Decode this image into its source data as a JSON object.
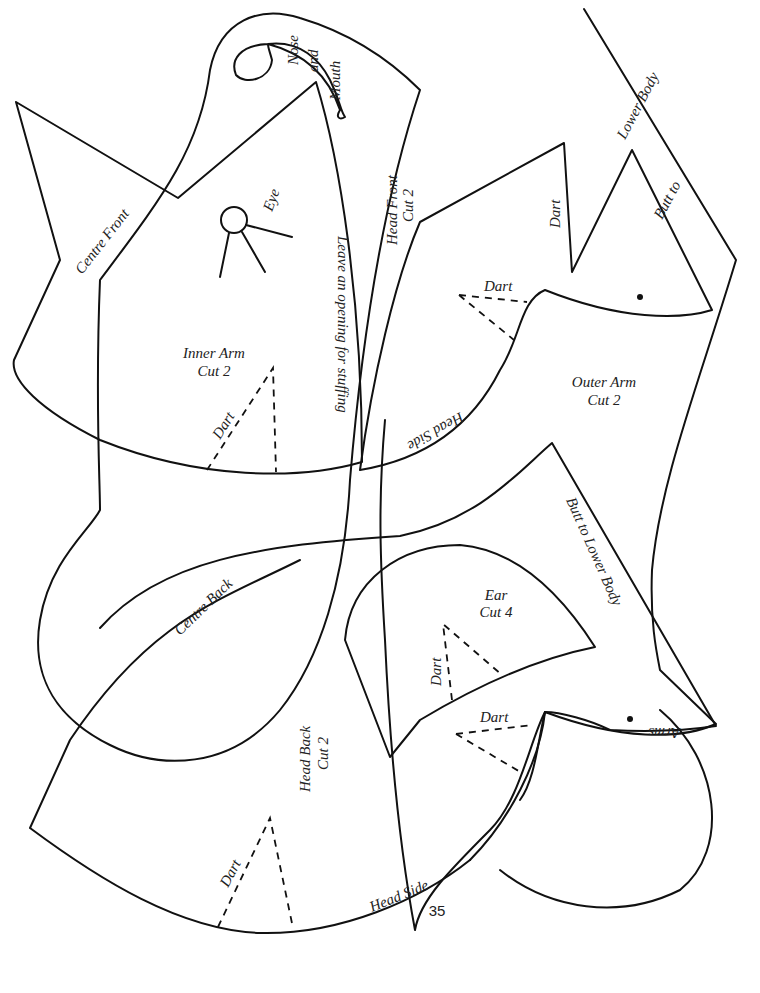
{
  "page": {
    "number": "35",
    "background": "#ffffff",
    "line_color": "#111111"
  },
  "pieces": {
    "inner_arm": {
      "title": "Inner Arm",
      "cut": "Cut 2",
      "dart": "Dart",
      "edge_centre_front": "Centre Front",
      "opening_note": "Leave an opening for stuffing",
      "eye_label": "Eye",
      "nose_label": "Nose",
      "and_label": "and",
      "mouth_label": "Mouth"
    },
    "head_front": {
      "title": "Head Front",
      "cut": "Cut 2",
      "dart_top": "Dart",
      "dart_mid": "Dart",
      "edge_head_side": "Head Side"
    },
    "outer_arm": {
      "title": "Outer Arm",
      "cut": "Cut 2",
      "edge_butt_to": "Butt to",
      "edge_lower_body": "Lower Body"
    },
    "body_lower": {
      "edge_butt_to_lower_body": "Butt to Lower Body",
      "edge_arms": "Arms",
      "dart": "Dart"
    },
    "ear": {
      "title": "Ear",
      "cut": "Cut 4",
      "dart": "Dart"
    },
    "head_back": {
      "title": "Head Back",
      "cut": "Cut 2",
      "dart": "Dart",
      "edge_head_side": "Head Side",
      "edge_centre_back": "Centre Back"
    }
  }
}
